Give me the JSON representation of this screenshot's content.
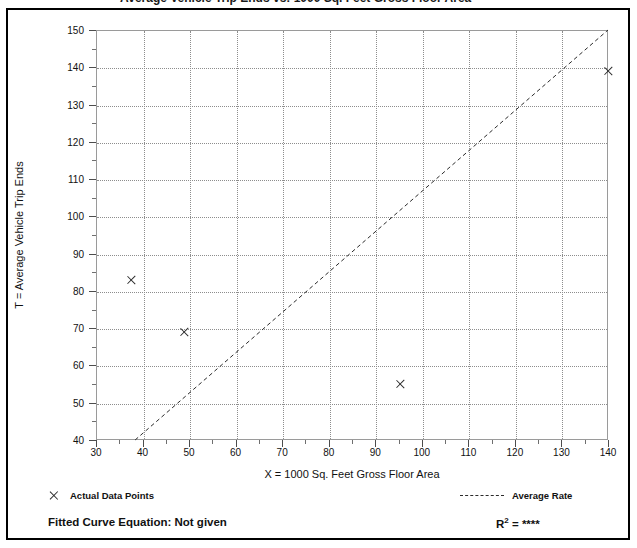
{
  "top_partial_text": "Average Vehicle Trip Ends vs:  1000 Sq. Feet Gross Floor Area",
  "chart_data": {
    "type": "scatter",
    "title": "",
    "xlabel": "X = 1000 Sq. Feet Gross Floor Area",
    "ylabel": "T = Average Vehicle Trip Ends",
    "xlim": [
      30,
      140
    ],
    "ylim": [
      40,
      150
    ],
    "xticks": [
      30,
      40,
      50,
      60,
      70,
      80,
      90,
      100,
      110,
      120,
      130,
      140
    ],
    "yticks": [
      40,
      50,
      60,
      70,
      80,
      90,
      100,
      110,
      120,
      130,
      140,
      150
    ],
    "x_minor_interval": 5,
    "y_minor_interval": 5,
    "grid": true,
    "legend_position": "below-plot",
    "series": [
      {
        "name": "Actual Data Points",
        "type": "scatter",
        "marker": "x",
        "color": "#2b2b2b",
        "points": [
          {
            "x": 37.6,
            "y": 83
          },
          {
            "x": 49.0,
            "y": 69
          },
          {
            "x": 95.4,
            "y": 55
          },
          {
            "x": 140.0,
            "y": 139
          }
        ]
      },
      {
        "name": "Average Rate",
        "type": "line",
        "style": "dashed",
        "color": "#2b2b2b",
        "points": [
          {
            "x": 38.4,
            "y": 40
          },
          {
            "x": 140.0,
            "y": 150
          }
        ]
      }
    ],
    "annotations": {
      "fitted_curve_equation_label": "Fitted Curve Equation:",
      "fitted_curve_equation_value": "Not given",
      "r_squared_label": "R",
      "r_squared_exponent": "2",
      "r_squared_value": "= ****"
    }
  },
  "legend": {
    "data_points_label": "Actual Data Points",
    "average_rate_label": "Average Rate"
  },
  "footer": {
    "fitted_curve_text": "Fitted Curve Equation:  Not given",
    "r2_text": "= ****"
  }
}
